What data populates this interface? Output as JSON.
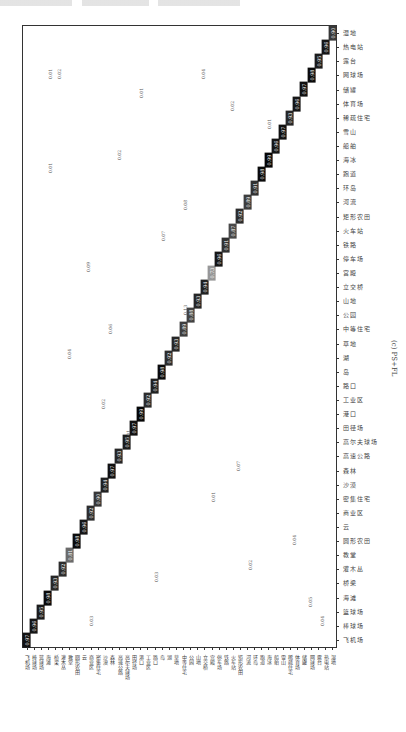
{
  "caption": "(c) PS+FL",
  "chart_data": {
    "type": "heatmap",
    "title": "(c) PS+FL",
    "subtype": "confusion_matrix",
    "orientation_note": "matrix rendered rotated; diagonal runs bottom-left to top-right",
    "classes": [
      "飞机场",
      "棒球场",
      "篮球场",
      "海滩",
      "桥梁",
      "灌木丛",
      "教堂",
      "圆形农田",
      "云",
      "商业区",
      "密集住宅",
      "沙漠",
      "森林",
      "高速公路",
      "高尔夫球场",
      "田径场",
      "港口",
      "工业区",
      "路口",
      "岛",
      "湖",
      "草地",
      "中等住宅",
      "公园",
      "山地",
      "立交桥",
      "宫殿",
      "停车场",
      "铁路",
      "火车站",
      "矩形农田",
      "河流",
      "环岛",
      "跑道",
      "海冰",
      "船舶",
      "雪山",
      "稀疏住宅",
      "体育场",
      "储罐",
      "网球场",
      "露台",
      "热电站",
      "湿地"
    ],
    "diagonal": [
      0.97,
      0.96,
      0.95,
      0.98,
      0.93,
      0.92,
      0.81,
      0.98,
      0.96,
      0.92,
      0.9,
      0.94,
      0.97,
      0.93,
      0.95,
      0.97,
      0.99,
      0.92,
      0.94,
      0.98,
      0.92,
      0.93,
      0.89,
      0.88,
      0.93,
      0.94,
      0.73,
      0.96,
      0.91,
      0.87,
      0.92,
      0.89,
      0.91,
      0.98,
      0.99,
      0.96,
      0.97,
      0.93,
      0.96,
      0.97,
      0.98,
      0.95,
      0.96,
      0.9
    ],
    "off_diagonal_samples": [
      {
        "label": "0.01",
        "x": 0.08,
        "y": 0.93
      },
      {
        "label": "0.01",
        "x": 0.08,
        "y": 0.78
      },
      {
        "label": "0.02",
        "x": 0.11,
        "y": 0.93
      },
      {
        "label": "0.13",
        "x": 0.51,
        "y": 0.55
      },
      {
        "label": "0.08",
        "x": 0.51,
        "y": 0.72
      },
      {
        "label": "0.07",
        "x": 0.44,
        "y": 0.67
      },
      {
        "label": "0.06",
        "x": 0.27,
        "y": 0.52
      },
      {
        "label": "0.09",
        "x": 0.2,
        "y": 0.62
      },
      {
        "label": "0.04",
        "x": 0.14,
        "y": 0.48
      },
      {
        "label": "0.02",
        "x": 0.25,
        "y": 0.4
      },
      {
        "label": "0.01",
        "x": 0.33,
        "y": 0.35
      },
      {
        "label": "0.03",
        "x": 0.42,
        "y": 0.12
      },
      {
        "label": "0.07",
        "x": 0.68,
        "y": 0.3
      },
      {
        "label": "0.04",
        "x": 0.86,
        "y": 0.18
      },
      {
        "label": "0.05",
        "x": 0.91,
        "y": 0.08
      },
      {
        "label": "0.04",
        "x": 0.95,
        "y": 0.05
      },
      {
        "label": "0.02",
        "x": 0.72,
        "y": 0.14
      },
      {
        "label": "0.01",
        "x": 0.6,
        "y": 0.25
      },
      {
        "label": "0.02",
        "x": 0.66,
        "y": 0.88
      },
      {
        "label": "0.01",
        "x": 0.78,
        "y": 0.85
      },
      {
        "label": "0.04",
        "x": 0.57,
        "y": 0.93
      },
      {
        "label": "0.01",
        "x": 0.37,
        "y": 0.9
      },
      {
        "label": "0.02",
        "x": 0.3,
        "y": 0.8
      },
      {
        "label": "0.03",
        "x": 0.21,
        "y": 0.05
      }
    ],
    "value_range": [
      0,
      1
    ],
    "colormap": {
      "high": "#000000",
      "mid": "#888888",
      "low": "#ffffff"
    },
    "grid": false
  }
}
